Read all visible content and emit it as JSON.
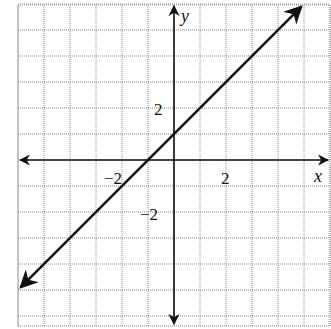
{
  "chart_data": {
    "type": "line",
    "title": "",
    "xlabel": "x",
    "ylabel": "y",
    "xlim": [
      -6,
      6
    ],
    "ylim": [
      -6,
      6
    ],
    "grid": true,
    "grid_step": 1,
    "x_tick_labels": [
      {
        "value": -2,
        "label": "−2"
      },
      {
        "value": 2,
        "label": "2"
      }
    ],
    "y_tick_labels": [
      {
        "value": 2,
        "label": "2"
      },
      {
        "value": -2,
        "label": "−2"
      }
    ],
    "series": [
      {
        "name": "y = x + 1",
        "equation": "y = x + 1",
        "slope": 1,
        "intercept": 1,
        "x": [
          -6,
          -1,
          0,
          5
        ],
        "y": [
          -5,
          0,
          1,
          6
        ],
        "arrows": "both"
      }
    ],
    "legend": null
  },
  "labels": {
    "x_axis": "x",
    "y_axis": "y",
    "x_tick_neg2": "−2",
    "x_tick_2": "2",
    "y_tick_2": "2",
    "y_tick_neg2": "−2"
  },
  "colors": {
    "line": "#111111",
    "grid": "#8a8a8a",
    "background": "#ffffff"
  }
}
